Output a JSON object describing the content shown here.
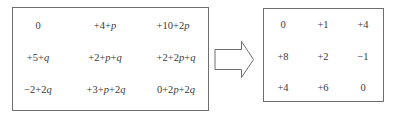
{
  "left_matrix": {
    "rows": [
      [
        "0",
        "+4+p",
        "+10+2p"
      ],
      [
        "+5+q",
        "+2+p+q",
        "+2+2p+q"
      ],
      [
        "−2+2q",
        "+3+p+2q",
        "0+2p+2q"
      ]
    ]
  },
  "arrow": {
    "direction": "right",
    "icon": "hollow-right-arrow-icon"
  },
  "right_matrix": {
    "rows": [
      [
        "0",
        "+1",
        "+4"
      ],
      [
        "+8",
        "+2",
        "−1"
      ],
      [
        "+4",
        "+6",
        "0"
      ]
    ]
  },
  "colors": {
    "border": "#6e6e6e",
    "text": "#3a3a3a",
    "background": "#ffffff"
  }
}
